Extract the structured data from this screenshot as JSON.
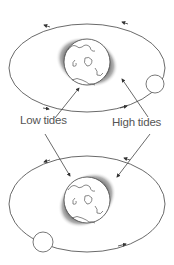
{
  "labels": {
    "low_tides": "Low tides",
    "high_tides": "High tides"
  },
  "colors": {
    "line": "#444444",
    "label": "#555555",
    "shadow": "#333333"
  },
  "panels": [
    {
      "name": "top",
      "moon_position": "right"
    },
    {
      "name": "bottom",
      "moon_position": "lower-left"
    }
  ]
}
